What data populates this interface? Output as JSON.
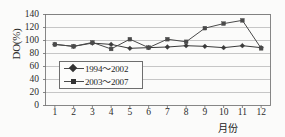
{
  "chart_data": {
    "type": "line",
    "title": "",
    "xlabel": "月份",
    "ylabel": "DO(%)",
    "ylim": [
      0,
      140
    ],
    "ytick_step": 20,
    "grid": true,
    "legend_position": "inside-left-middle",
    "x": [
      1,
      2,
      3,
      4,
      5,
      6,
      7,
      8,
      9,
      10,
      11,
      12
    ],
    "xtick_labels": [
      "1",
      "2",
      "3",
      "4",
      "5",
      "6",
      "7",
      "8",
      "9",
      "10",
      "11",
      "12"
    ],
    "ytick_labels": [
      "0",
      "20",
      "40",
      "60",
      "80",
      "100",
      "120",
      "140"
    ],
    "ytick_values": [
      0,
      20,
      40,
      60,
      80,
      100,
      120,
      140
    ],
    "series": [
      {
        "name": "1994～2002",
        "marker": "diamond",
        "color": "#3a3a3a",
        "values": [
          94,
          91,
          96,
          94,
          88,
          89,
          90,
          92,
          91,
          89,
          92,
          89
        ]
      },
      {
        "name": "2003～2007",
        "marker": "square",
        "color": "#4a4a4a",
        "values": [
          94,
          91,
          97,
          87,
          102,
          89,
          102,
          98,
          119,
          126,
          131,
          88
        ]
      }
    ]
  },
  "axes": {
    "y_title": "DO(%)",
    "x_title": "月份"
  },
  "legend": {
    "items": [
      {
        "label": "1994～2002",
        "marker": "diamond-marker"
      },
      {
        "label": "2003～2007",
        "marker": "square-marker"
      }
    ]
  },
  "colors": {
    "grid": "#b9b9b9",
    "frame": "#7a7a7a",
    "series_1": "#3a3a3a",
    "series_2": "#4a4a4a",
    "background": "#fbfbfa"
  }
}
